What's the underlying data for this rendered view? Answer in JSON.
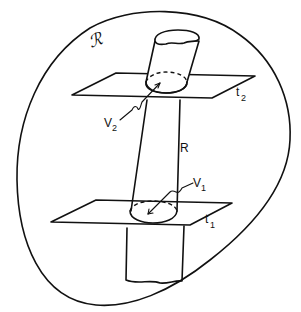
{
  "diagram": {
    "type": "figure",
    "colors": {
      "ink": "#111111",
      "background": "#ffffff"
    },
    "labels": {
      "region": "ℛ",
      "tube": "R",
      "upper_plane": "t",
      "upper_plane_sub": "2",
      "lower_plane": "t",
      "lower_plane_sub": "1",
      "upper_section": "V",
      "upper_section_sub": "2",
      "lower_section": "V",
      "lower_section_sub": "1"
    }
  }
}
